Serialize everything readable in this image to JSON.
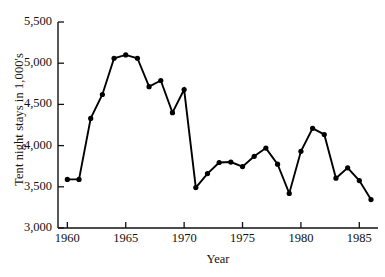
{
  "chart_data": {
    "type": "line",
    "title": "",
    "xlabel": "Year",
    "ylabel": "Tent night stays in 1,000's",
    "xlim": [
      1959.2,
      1986.6
    ],
    "ylim": [
      3000,
      5500
    ],
    "grid": false,
    "legend": null,
    "marker": "filled-circle",
    "x_tick_labels": [
      "1960",
      "1965",
      "1970",
      "1975",
      "1980",
      "1985"
    ],
    "x_ticks": [
      1960,
      1965,
      1970,
      1975,
      1980,
      1985
    ],
    "y_tick_labels": [
      "3,000",
      "3,500",
      "4,000",
      "4,500",
      "5,000",
      "5,500"
    ],
    "y_ticks": [
      3000,
      3500,
      4000,
      4500,
      5000,
      5500
    ],
    "x": [
      1960,
      1961,
      1962,
      1963,
      1964,
      1965,
      1966,
      1967,
      1968,
      1969,
      1970,
      1971,
      1972,
      1973,
      1974,
      1975,
      1976,
      1977,
      1978,
      1979,
      1980,
      1981,
      1982,
      1983,
      1984,
      1985,
      1986
    ],
    "values": [
      3590,
      3590,
      4330,
      4620,
      5060,
      5100,
      5060,
      4715,
      4790,
      4400,
      4680,
      3490,
      3660,
      3795,
      3800,
      3745,
      3870,
      3970,
      3775,
      3420,
      3930,
      4210,
      4135,
      3605,
      3730,
      3575,
      3345
    ],
    "series": [
      {
        "name": "Tent night stays",
        "values": [
          3590,
          3590,
          4330,
          4620,
          5060,
          5100,
          5060,
          4715,
          4790,
          4400,
          4680,
          3490,
          3660,
          3795,
          3800,
          3745,
          3870,
          3970,
          3775,
          3420,
          3930,
          4210,
          4135,
          3605,
          3730,
          3575,
          3345
        ]
      }
    ],
    "line_color": "#000000",
    "marker_color": "#000000",
    "background_color": "#ffffff"
  }
}
